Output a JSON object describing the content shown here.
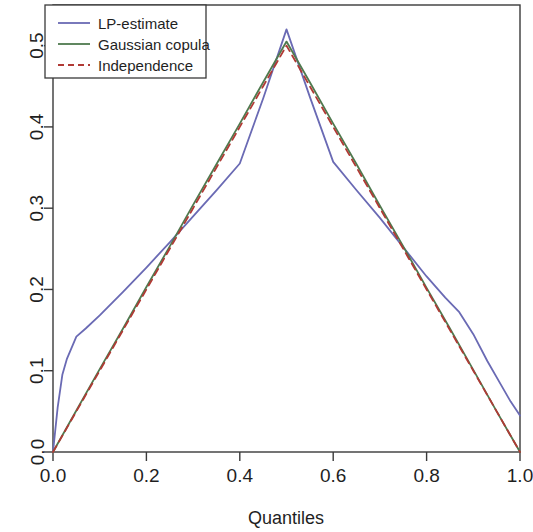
{
  "chart_data": {
    "type": "line",
    "title": "",
    "xlabel": "Quantiles",
    "ylabel": "",
    "xlim": [
      0.0,
      1.0
    ],
    "ylim": [
      0.0,
      0.55
    ],
    "grid": false,
    "legend_position": "top-left",
    "x_ticks": [
      "0.0",
      "0.2",
      "0.4",
      "0.6",
      "0.8",
      "1.0"
    ],
    "x_tick_values": [
      0.0,
      0.2,
      0.4,
      0.6,
      0.8,
      1.0
    ],
    "y_ticks": [
      "0.0",
      "0.1",
      "0.2",
      "0.3",
      "0.4",
      "0.5"
    ],
    "y_tick_values": [
      0.0,
      0.1,
      0.2,
      0.3,
      0.4,
      0.5
    ],
    "series": [
      {
        "name": "LP-estimate",
        "color": "#6a6ab4",
        "style": "solid",
        "x": [
          0.0,
          0.01,
          0.02,
          0.03,
          0.05,
          0.07,
          0.1,
          0.15,
          0.2,
          0.25,
          0.3,
          0.35,
          0.4,
          0.45,
          0.5,
          0.55,
          0.6,
          0.65,
          0.7,
          0.75,
          0.8,
          0.84,
          0.87,
          0.9,
          0.93,
          0.96,
          0.98,
          1.0
        ],
        "y": [
          0.0,
          0.055,
          0.095,
          0.115,
          0.142,
          0.152,
          0.168,
          0.197,
          0.227,
          0.258,
          0.29,
          0.322,
          0.355,
          0.435,
          0.52,
          0.437,
          0.357,
          0.322,
          0.288,
          0.252,
          0.216,
          0.19,
          0.172,
          0.145,
          0.112,
          0.082,
          0.062,
          0.045
        ]
      },
      {
        "name": "Gaussian copula",
        "color": "#4f7a4f",
        "style": "solid",
        "x": [
          0.0,
          0.05,
          0.1,
          0.15,
          0.2,
          0.25,
          0.3,
          0.35,
          0.4,
          0.45,
          0.5,
          0.55,
          0.6,
          0.65,
          0.7,
          0.75,
          0.8,
          0.85,
          0.9,
          0.95,
          1.0
        ],
        "y": [
          0.0,
          0.051,
          0.102,
          0.152,
          0.203,
          0.253,
          0.304,
          0.354,
          0.404,
          0.455,
          0.505,
          0.455,
          0.404,
          0.354,
          0.303,
          0.253,
          0.202,
          0.152,
          0.101,
          0.05,
          0.0
        ]
      },
      {
        "name": "Independence",
        "color": "#b03a35",
        "style": "dashed",
        "x": [
          0.0,
          0.05,
          0.1,
          0.15,
          0.2,
          0.25,
          0.3,
          0.35,
          0.4,
          0.45,
          0.5,
          0.55,
          0.6,
          0.65,
          0.7,
          0.75,
          0.8,
          0.85,
          0.9,
          0.95,
          1.0
        ],
        "y": [
          0.0,
          0.05,
          0.1,
          0.15,
          0.2,
          0.25,
          0.3,
          0.35,
          0.4,
          0.45,
          0.5,
          0.45,
          0.4,
          0.35,
          0.3,
          0.25,
          0.2,
          0.15,
          0.1,
          0.05,
          0.0
        ]
      }
    ]
  },
  "legend": {
    "entries": [
      {
        "label": "LP-estimate"
      },
      {
        "label": "Gaussian copula"
      },
      {
        "label": "Independence"
      }
    ]
  },
  "axes": {
    "x_title": "Quantiles"
  }
}
